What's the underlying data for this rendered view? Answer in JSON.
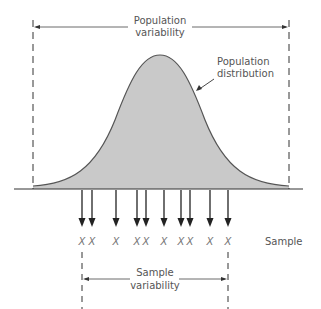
{
  "diagram": {
    "labels": {
      "population_variability": [
        "Population",
        "variability"
      ],
      "population_distribution": [
        "Population",
        "distribution"
      ],
      "sample": "Sample",
      "sample_variability": [
        "Sample",
        "variability"
      ]
    },
    "sample_marker": "X",
    "sample_x_positions": [
      82,
      92,
      116,
      137,
      146,
      164,
      181,
      190,
      210,
      228
    ],
    "colors": {
      "curve_fill": "#c9c9c9",
      "curve_stroke": "#555555",
      "line": "#333333",
      "text": "#555555"
    },
    "geometry": {
      "baseline_y": 189,
      "baseline_x": [
        14,
        303
      ],
      "population_bounds_x": [
        33,
        289
      ],
      "peak": [
        160,
        55
      ],
      "sample_bounds_x": [
        82,
        228
      ]
    }
  }
}
